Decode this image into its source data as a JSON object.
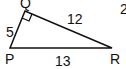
{
  "diagram": {
    "type": "right-triangle",
    "vertices": {
      "P": "P",
      "Q": "Q",
      "R": "R"
    },
    "sides": {
      "PQ": "5",
      "QR": "12",
      "PR": "13"
    },
    "right_angle_at": "Q",
    "corner_glyph": "2"
  }
}
